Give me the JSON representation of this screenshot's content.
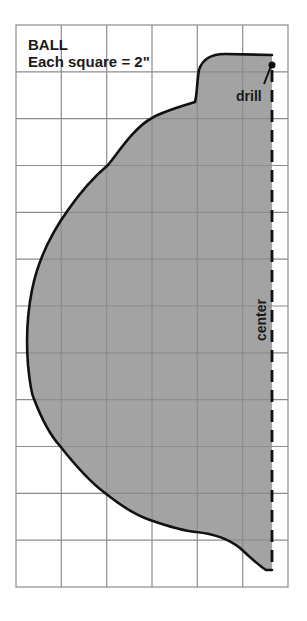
{
  "title": "BALL",
  "scale_note": "Each square = 2\"",
  "labels": {
    "drill": "drill",
    "center": "center"
  },
  "grid": {
    "columns": 6,
    "rows": 12,
    "square_size_inches": 2,
    "line_color": "#8c8c8c"
  },
  "colors": {
    "shape_fill": "#a3a3a3",
    "outline": "#111111",
    "background": "#ffffff"
  }
}
